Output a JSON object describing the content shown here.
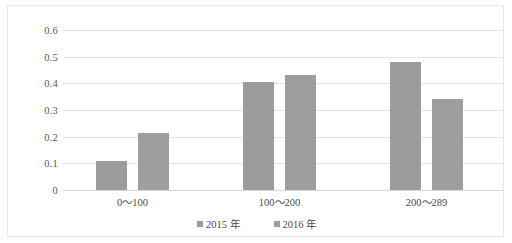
{
  "chart_data": {
    "type": "bar",
    "title": "",
    "subtitle": "",
    "xlabel": "",
    "ylabel": "",
    "categories": [
      "0～100",
      "100～200",
      "200～289"
    ],
    "series": [
      {
        "name": "2015 年",
        "values": [
          0.11,
          0.405,
          0.48
        ],
        "color": "#9c9c9c"
      },
      {
        "name": "2016 年",
        "values": [
          0.215,
          0.43,
          0.34
        ],
        "color": "#9e9e9e"
      }
    ],
    "ylim": [
      0,
      0.6
    ],
    "ytick_labels": [
      "0.6",
      "0.5",
      "0.4",
      "0.3",
      "0.2",
      "0.1",
      "0"
    ],
    "ytick_values": [
      0.6,
      0.5,
      0.4,
      0.3,
      0.2,
      0.1,
      0
    ],
    "grid": true,
    "grid_axis": "y",
    "legend_position": "bottom",
    "plot_background": "#ffffff",
    "gridline_color": "#e4e4e4",
    "border_color": "#e8e8e8"
  }
}
